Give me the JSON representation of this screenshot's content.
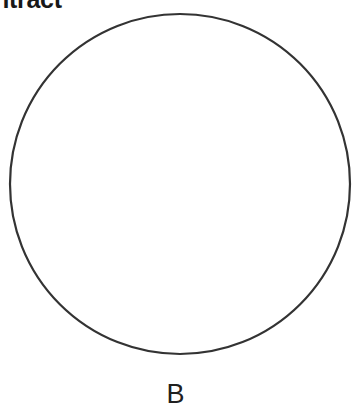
{
  "figure": {
    "heading": "ntract",
    "heading_clipped": true,
    "background_color": "#ffffff",
    "shape": {
      "icon": "circle-outline-icon",
      "type": "circle",
      "stroke_color": "#333333",
      "stroke_width": 2,
      "fill": "none",
      "center_x": 180,
      "center_y": 184,
      "radius": 170,
      "clipped_top": true
    },
    "label": {
      "text": "B",
      "color": "#202020"
    }
  }
}
